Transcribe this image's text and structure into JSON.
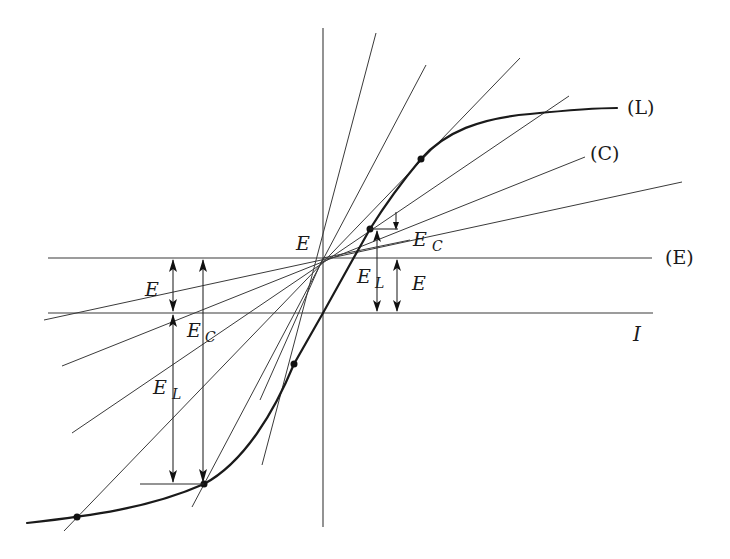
{
  "diagram": {
    "title": "",
    "colors": {
      "background": "#ffffff",
      "line": "#3a3a3a",
      "curve": "#1a1a1a"
    },
    "labels": {
      "curve_L": "(L)",
      "line_C": "(C)",
      "line_E": "(E)",
      "axis_I": "I",
      "pivot_E": "E",
      "right_E_C_main": "E",
      "right_E_C_sub": "C",
      "right_E_L_main": "E",
      "right_E_L_sub": "L",
      "right_E": "E",
      "left_E": "E",
      "left_E_C_main": "E",
      "left_E_C_sub": "C",
      "left_E_L_main": "E",
      "left_E_L_sub": "L"
    },
    "elements": {
      "vertical_axis": {
        "x": 323,
        "y_top": 28,
        "y_bottom": 527
      },
      "line_E_horizontal": {
        "y": 258,
        "x_left": 48,
        "x_right": 652
      },
      "axis_I_horizontal": {
        "y": 313,
        "x_left": 48,
        "x_right": 653
      },
      "pivot_point": {
        "x": 323,
        "y": 258
      },
      "curve_points": [
        [
          27,
          523
        ],
        [
          77,
          517
        ],
        [
          140,
          507
        ],
        [
          204,
          484
        ],
        [
          250,
          440
        ],
        [
          294,
          364
        ],
        [
          323,
          313
        ],
        [
          348,
          268
        ],
        [
          370,
          229
        ],
        [
          395,
          191
        ],
        [
          421,
          159
        ],
        [
          460,
          128
        ],
        [
          520,
          116
        ],
        [
          617,
          108
        ]
      ],
      "curve_dots": [
        [
          77,
          517
        ],
        [
          204,
          484
        ],
        [
          294,
          364
        ],
        [
          370,
          229
        ],
        [
          421,
          159
        ]
      ]
    }
  }
}
